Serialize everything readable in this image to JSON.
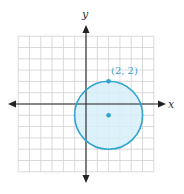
{
  "figure": {
    "type": "coordinate-plane-circle",
    "axes": {
      "x_label": "x",
      "y_label": "y",
      "x_range": [
        -6,
        6
      ],
      "y_range": [
        -6,
        6
      ],
      "grid": true
    },
    "circle": {
      "center": [
        2,
        -1
      ],
      "radius": 3,
      "fill_color": "#d6eef8",
      "stroke_color": "#2fa3cf"
    },
    "points": [
      {
        "label": "(2, 2)",
        "x": 2,
        "y": 2
      },
      {
        "label": "",
        "x": 2,
        "y": -1
      }
    ],
    "colors": {
      "grid": "#d0d0d0",
      "axis": "#222222",
      "accent": "#2fa3cf"
    }
  }
}
